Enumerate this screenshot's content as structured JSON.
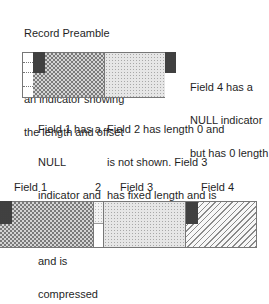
{
  "annotations": {
    "record_preamble": [
      "Record Preamble",
      "contains for each  field",
      "an indicator showing",
      "the length and offset"
    ],
    "field4_note": [
      "Field 4 has a",
      "NULL indicator",
      "but has 0 length"
    ],
    "field1_note": [
      "Field 1 has a",
      "NULL",
      "indicator and",
      "holds a value",
      "and is",
      "compressed"
    ],
    "field2_3_note": [
      "Field 2 has length 0 and",
      "is not shown. Field 3",
      "has fixed length and is",
      "compressed"
    ]
  },
  "bottom_labels": {
    "field1": "Field 1",
    "field2": "2",
    "field3": "Field 3",
    "field4": "Field 4"
  },
  "colors": {
    "null_indicator": "#2e2e2e",
    "outline": "#555555"
  }
}
